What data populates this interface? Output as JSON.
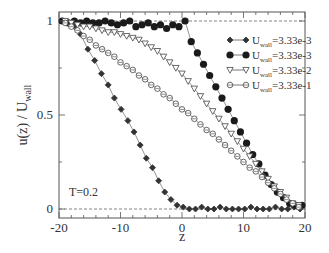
{
  "chart_data": {
    "type": "line",
    "title": "",
    "xlabel": "z",
    "ylabel": "u(z) / U_wall",
    "ylabel_main": "u(z) / U",
    "ylabel_sub": "wall",
    "xlim": [
      -20,
      20
    ],
    "ylim": [
      -0.05,
      1.05
    ],
    "xticks": [
      -20,
      -10,
      0,
      10,
      20
    ],
    "xtick_labels": [
      "-20",
      "-10",
      "0",
      "10",
      "20"
    ],
    "yticks": [
      0,
      0.5,
      1
    ],
    "ytick_labels": [
      "0",
      "0.5",
      "1"
    ],
    "grid": false,
    "reference_lines": [
      0,
      1
    ],
    "legend_position": "upper right",
    "annotation": "T=0.2",
    "series": [
      {
        "name": "U_wall=3.33e-3",
        "legend_main": "U",
        "legend_sub": "wall",
        "legend_value": "=3.33e-3",
        "marker": "small-filled-diamond",
        "x": [
          -19.5,
          -18.5,
          -17.5,
          -16.5,
          -15.3,
          -14.2,
          -13.1,
          -12.0,
          -11.0,
          -9.9,
          -8.8,
          -7.8,
          -6.8,
          -5.8,
          -4.8,
          -3.8,
          -2.8,
          -1.8,
          -0.8,
          0.2,
          1.2,
          2.2,
          3.2,
          4.2,
          5.2,
          6.2,
          7.2,
          8.2,
          9.2,
          10.2,
          11.2,
          12.2,
          13.2,
          14.2,
          15.2,
          16.2,
          17.2,
          18.2,
          19.2
        ],
        "y": [
          1.0,
          0.99,
          0.97,
          0.93,
          0.85,
          0.79,
          0.72,
          0.66,
          0.59,
          0.53,
          0.47,
          0.41,
          0.34,
          0.27,
          0.22,
          0.15,
          0.09,
          0.05,
          0.02,
          0.01,
          0.0,
          0.0,
          0.01,
          0.0,
          0.0,
          0.01,
          0.0,
          0.0,
          0.0,
          0.0,
          0.01,
          0.0,
          0.0,
          0.0,
          0.01,
          0.0,
          0.0,
          0.01,
          0.0
        ]
      },
      {
        "name": "U_wall=3.33e-3",
        "legend_main": "U",
        "legend_sub": "wall",
        "legend_value": "=3.33e-3",
        "marker": "large-filled-circle",
        "x": [
          -19.5,
          -18.5,
          -17.5,
          -16.5,
          -15.5,
          -14.5,
          -13.5,
          -12.5,
          -11.5,
          -10.5,
          -9.5,
          -8.5,
          -7.5,
          -6.5,
          -5.5,
          -4.5,
          -3.5,
          -2.5,
          -1.5,
          -0.5,
          0.5,
          1.5,
          2.5,
          3.5,
          4.5,
          5.5,
          6.5,
          7.5,
          8.5,
          9.5,
          10.5,
          11.5,
          12.5,
          13.5,
          14.5,
          15.5,
          16.5,
          17.5,
          18.5,
          19.5
        ],
        "y": [
          1.0,
          0.99,
          1.0,
          0.99,
          1.0,
          0.99,
          0.99,
          1.0,
          0.99,
          0.98,
          0.99,
          1.0,
          0.97,
          0.98,
          0.99,
          0.97,
          0.98,
          0.96,
          0.98,
          0.97,
          1.0,
          0.89,
          0.83,
          0.77,
          0.71,
          0.65,
          0.59,
          0.53,
          0.47,
          0.41,
          0.35,
          0.29,
          0.24,
          0.18,
          0.13,
          0.09,
          0.06,
          0.03,
          0.02,
          0.02
        ]
      },
      {
        "name": "U_wall=3.33e-2",
        "legend_main": "U",
        "legend_sub": "wall",
        "legend_value": "=3.33e-2",
        "marker": "open-down-triangle",
        "x": [
          -19.0,
          -18.0,
          -17.0,
          -16.0,
          -15.0,
          -14.0,
          -13.0,
          -12.0,
          -11.0,
          -10.0,
          -9.0,
          -8.0,
          -7.0,
          -6.0,
          -5.0,
          -4.0,
          -3.0,
          -2.0,
          -1.0,
          0.0,
          1.0,
          2.0,
          3.0,
          4.0,
          5.0,
          6.0,
          7.0,
          8.0,
          9.0,
          10.0,
          11.0,
          12.0,
          13.0,
          14.0,
          15.0,
          16.0,
          17.0,
          18.0,
          19.0
        ],
        "y": [
          1.0,
          0.99,
          0.98,
          0.97,
          0.97,
          0.96,
          0.95,
          0.94,
          0.94,
          0.93,
          0.92,
          0.91,
          0.9,
          0.88,
          0.86,
          0.84,
          0.81,
          0.78,
          0.75,
          0.72,
          0.68,
          0.64,
          0.6,
          0.56,
          0.52,
          0.48,
          0.44,
          0.4,
          0.36,
          0.32,
          0.28,
          0.24,
          0.2,
          0.16,
          0.12,
          0.09,
          0.06,
          0.03,
          0.02
        ]
      },
      {
        "name": "U_wall=3.33e-1",
        "legend_main": "U",
        "legend_sub": "wall",
        "legend_value": "=3.33e-1",
        "marker": "open-circle",
        "x": [
          -19.0,
          -18.0,
          -17.0,
          -16.0,
          -15.0,
          -14.0,
          -13.0,
          -12.0,
          -11.0,
          -10.0,
          -9.0,
          -8.0,
          -7.0,
          -6.0,
          -5.0,
          -4.0,
          -3.0,
          -2.0,
          -1.0,
          0.0,
          1.0,
          2.0,
          3.0,
          4.0,
          5.0,
          6.0,
          7.0,
          8.0,
          9.0,
          10.0,
          11.0,
          12.0,
          13.0,
          14.0,
          15.0,
          16.0,
          17.0,
          18.0,
          19.0
        ],
        "y": [
          0.99,
          0.97,
          0.95,
          0.92,
          0.9,
          0.87,
          0.85,
          0.83,
          0.81,
          0.78,
          0.76,
          0.74,
          0.71,
          0.69,
          0.66,
          0.64,
          0.61,
          0.59,
          0.56,
          0.53,
          0.51,
          0.48,
          0.45,
          0.42,
          0.4,
          0.37,
          0.34,
          0.31,
          0.28,
          0.25,
          0.22,
          0.2,
          0.17,
          0.14,
          0.11,
          0.08,
          0.05,
          0.03,
          0.01
        ]
      }
    ]
  }
}
